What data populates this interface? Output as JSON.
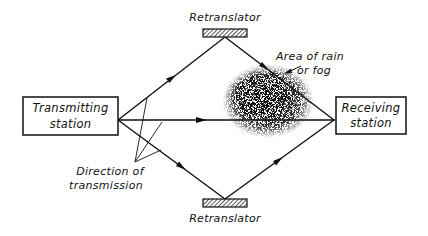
{
  "diagram": {
    "type": "radio-relay transmission paths with retranslators",
    "colors": {
      "ink": "#111111",
      "background": "#ffffff",
      "fog": "#222222"
    },
    "nodes": {
      "transmitter": {
        "line1": "Transmitting",
        "line2": "station"
      },
      "receiver": {
        "line1": "Receiving",
        "line2": "station"
      },
      "retranslator_top": {
        "label": "Retranslator"
      },
      "retranslator_bottom": {
        "label": "Retranslator"
      }
    },
    "annotations": {
      "fog": {
        "line1": "Area of rain",
        "line2": "or fog"
      },
      "direction": {
        "line1": "Direction of",
        "line2": "transmission"
      }
    },
    "paths": [
      {
        "from": "Transmitting station",
        "via": "Retranslator (top)",
        "to": "Receiving station",
        "passes_through": "Area of rain or fog"
      },
      {
        "from": "Transmitting station",
        "via": "direct",
        "to": "Receiving station",
        "passes_through": "Area of rain or fog"
      },
      {
        "from": "Transmitting station",
        "via": "Retranslator (bottom)",
        "to": "Receiving station"
      }
    ]
  }
}
